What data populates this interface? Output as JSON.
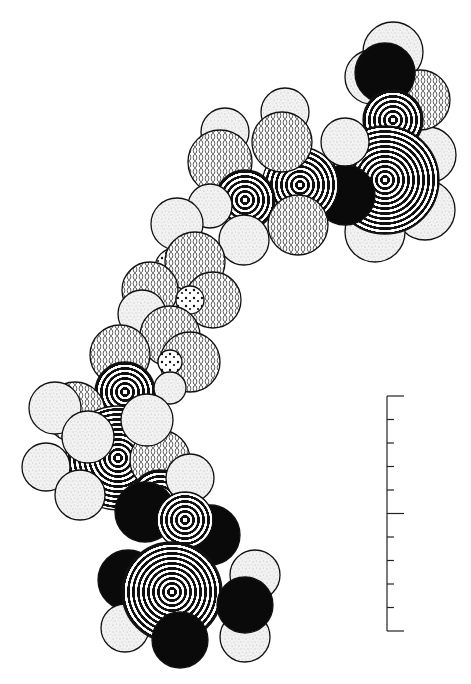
{
  "figure": {
    "type": "space-filling molecular model",
    "background": "#ffffff",
    "ink": "#111111"
  },
  "legend_fills": {
    "hydrogen": "stipple",
    "oxygen": "lattice",
    "carbon": "rings",
    "nitrogen": "black",
    "hbond": "dots"
  },
  "atoms": [
    {
      "id": "h1",
      "x": 393,
      "y": 52,
      "r": 30,
      "fill": "stipple"
    },
    {
      "id": "h2",
      "x": 372,
      "y": 77,
      "r": 27,
      "fill": "stipple"
    },
    {
      "id": "h3",
      "x": 428,
      "y": 155,
      "r": 28,
      "fill": "stipple"
    },
    {
      "id": "h4",
      "x": 425,
      "y": 210,
      "r": 30,
      "fill": "stipple"
    },
    {
      "id": "h5",
      "x": 375,
      "y": 232,
      "r": 30,
      "fill": "stipple"
    },
    {
      "id": "o1",
      "x": 420,
      "y": 100,
      "r": 30,
      "fill": "lattice"
    },
    {
      "id": "n1",
      "x": 385,
      "y": 73,
      "r": 30,
      "fill": "black"
    },
    {
      "id": "c1",
      "x": 393,
      "y": 120,
      "r": 30,
      "fill": "rings"
    },
    {
      "id": "c2",
      "x": 385,
      "y": 180,
      "r": 54,
      "fill": "rings"
    },
    {
      "id": "n2",
      "x": 345,
      "y": 195,
      "r": 30,
      "fill": "black"
    },
    {
      "id": "h6",
      "x": 345,
      "y": 142,
      "r": 24,
      "fill": "stipple"
    },
    {
      "id": "h7",
      "x": 285,
      "y": 112,
      "r": 24,
      "fill": "stipple"
    },
    {
      "id": "h8",
      "x": 225,
      "y": 132,
      "r": 24,
      "fill": "stipple"
    },
    {
      "id": "c3",
      "x": 300,
      "y": 185,
      "r": 38,
      "fill": "rings"
    },
    {
      "id": "o2",
      "x": 282,
      "y": 142,
      "r": 30,
      "fill": "lattice"
    },
    {
      "id": "o3",
      "x": 220,
      "y": 162,
      "r": 32,
      "fill": "lattice"
    },
    {
      "id": "c4",
      "x": 245,
      "y": 200,
      "r": 30,
      "fill": "rings"
    },
    {
      "id": "o4",
      "x": 298,
      "y": 225,
      "r": 30,
      "fill": "lattice"
    },
    {
      "id": "h9",
      "x": 210,
      "y": 206,
      "r": 22,
      "fill": "stipple"
    },
    {
      "id": "h10",
      "x": 177,
      "y": 224,
      "r": 26,
      "fill": "stipple"
    },
    {
      "id": "h11",
      "x": 244,
      "y": 240,
      "r": 25,
      "fill": "stipple"
    },
    {
      "id": "d1",
      "x": 175,
      "y": 268,
      "r": 20,
      "fill": "dots"
    },
    {
      "id": "o5",
      "x": 195,
      "y": 262,
      "r": 30,
      "fill": "lattice"
    },
    {
      "id": "o6",
      "x": 213,
      "y": 300,
      "r": 28,
      "fill": "lattice"
    },
    {
      "id": "o7",
      "x": 150,
      "y": 290,
      "r": 28,
      "fill": "lattice"
    },
    {
      "id": "d2",
      "x": 190,
      "y": 300,
      "r": 14,
      "fill": "dots"
    },
    {
      "id": "h12",
      "x": 142,
      "y": 314,
      "r": 24,
      "fill": "stipple"
    },
    {
      "id": "o8",
      "x": 170,
      "y": 336,
      "r": 30,
      "fill": "lattice"
    },
    {
      "id": "o9",
      "x": 190,
      "y": 362,
      "r": 30,
      "fill": "lattice"
    },
    {
      "id": "o10",
      "x": 120,
      "y": 355,
      "r": 30,
      "fill": "lattice"
    },
    {
      "id": "d3",
      "x": 170,
      "y": 362,
      "r": 12,
      "fill": "dots"
    },
    {
      "id": "c5",
      "x": 125,
      "y": 392,
      "r": 30,
      "fill": "rings"
    },
    {
      "id": "h13",
      "x": 170,
      "y": 388,
      "r": 16,
      "fill": "stipple"
    },
    {
      "id": "o11",
      "x": 75,
      "y": 412,
      "r": 30,
      "fill": "lattice"
    },
    {
      "id": "h14",
      "x": 55,
      "y": 408,
      "r": 26,
      "fill": "stipple"
    },
    {
      "id": "c6",
      "x": 118,
      "y": 458,
      "r": 52,
      "fill": "rings"
    },
    {
      "id": "o12",
      "x": 160,
      "y": 460,
      "r": 30,
      "fill": "lattice"
    },
    {
      "id": "h15",
      "x": 147,
      "y": 420,
      "r": 26,
      "fill": "stipple"
    },
    {
      "id": "h16",
      "x": 88,
      "y": 437,
      "r": 26,
      "fill": "stipple"
    },
    {
      "id": "h17",
      "x": 46,
      "y": 467,
      "r": 24,
      "fill": "stipple"
    },
    {
      "id": "h18",
      "x": 80,
      "y": 495,
      "r": 25,
      "fill": "stipple"
    },
    {
      "id": "c7",
      "x": 160,
      "y": 500,
      "r": 30,
      "fill": "rings"
    },
    {
      "id": "h19",
      "x": 190,
      "y": 478,
      "r": 24,
      "fill": "stipple"
    },
    {
      "id": "n3",
      "x": 145,
      "y": 512,
      "r": 30,
      "fill": "black"
    },
    {
      "id": "n4",
      "x": 210,
      "y": 535,
      "r": 30,
      "fill": "black"
    },
    {
      "id": "c8",
      "x": 185,
      "y": 520,
      "r": 28,
      "fill": "rings"
    },
    {
      "id": "n5",
      "x": 128,
      "y": 580,
      "r": 30,
      "fill": "black"
    },
    {
      "id": "h20",
      "x": 125,
      "y": 628,
      "r": 24,
      "fill": "stipple"
    },
    {
      "id": "h21",
      "x": 255,
      "y": 575,
      "r": 25,
      "fill": "stipple"
    },
    {
      "id": "h22",
      "x": 245,
      "y": 637,
      "r": 25,
      "fill": "stipple"
    },
    {
      "id": "c9",
      "x": 172,
      "y": 592,
      "r": 50,
      "fill": "rings"
    },
    {
      "id": "n6",
      "x": 180,
      "y": 640,
      "r": 28,
      "fill": "black"
    },
    {
      "id": "n7",
      "x": 245,
      "y": 605,
      "r": 28,
      "fill": "black"
    }
  ],
  "scale_bar": {
    "x": 387,
    "y_top": 396,
    "y_bottom": 631,
    "divisions": 10,
    "long_tick_len": 17,
    "short_tick_len": 7
  }
}
